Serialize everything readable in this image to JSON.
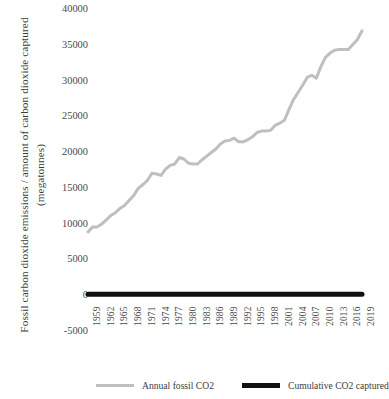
{
  "chart_data": {
    "type": "line",
    "title": "",
    "xlabel": "",
    "ylabel": "Fossil carbon dioxide emissions / amount of carbon dioxide captured",
    "ylabel_line2": "(megatonnes)",
    "ylim": [
      -5000,
      40000
    ],
    "ytick_labels": [
      "40000",
      "35000",
      "30000",
      "25000",
      "20000",
      "15000",
      "10000",
      "5000",
      "0",
      "-5000"
    ],
    "ytick_values": [
      40000,
      35000,
      30000,
      25000,
      20000,
      15000,
      10000,
      5000,
      0,
      -5000
    ],
    "grid": false,
    "legend_position": "bottom",
    "xtick_labels": [
      "1959",
      "1962",
      "1965",
      "1968",
      "1971",
      "1974",
      "1977",
      "1980",
      "1983",
      "1986",
      "1989",
      "1992",
      "1995",
      "1998",
      "2001",
      "2004",
      "2007",
      "2010",
      "2013",
      "2016",
      "2019"
    ],
    "x": [
      1959,
      1960,
      1961,
      1962,
      1963,
      1964,
      1965,
      1966,
      1967,
      1968,
      1969,
      1970,
      1971,
      1972,
      1973,
      1974,
      1975,
      1976,
      1977,
      1978,
      1979,
      1980,
      1981,
      1982,
      1983,
      1984,
      1985,
      1986,
      1987,
      1988,
      1989,
      1990,
      1991,
      1992,
      1993,
      1994,
      1995,
      1996,
      1997,
      1998,
      1999,
      2000,
      2001,
      2002,
      2003,
      2004,
      2005,
      2006,
      2007,
      2008,
      2009,
      2010,
      2011,
      2012,
      2013,
      2014,
      2015,
      2016,
      2017,
      2018,
      2019
    ],
    "series": [
      {
        "name": "Annual fossil CO2",
        "color": "#bfbfbf",
        "width": 3,
        "values": [
          8700,
          9400,
          9400,
          9800,
          10400,
          11000,
          11400,
          12000,
          12400,
          13100,
          13800,
          14800,
          15300,
          15900,
          16900,
          16800,
          16600,
          17500,
          18000,
          18200,
          19100,
          18900,
          18300,
          18200,
          18200,
          18800,
          19300,
          19800,
          20300,
          21000,
          21400,
          21500,
          21800,
          21300,
          21300,
          21600,
          22000,
          22600,
          22800,
          22800,
          22900,
          23600,
          23900,
          24300,
          25800,
          27200,
          28200,
          29200,
          30300,
          30600,
          30200,
          31800,
          33100,
          33700,
          34100,
          34200,
          34200,
          34200,
          34900,
          35600,
          36800
        ]
      },
      {
        "name": "Cumulative CO2 captured",
        "color": "#111111",
        "width": 5,
        "values": [
          0,
          0,
          0,
          0,
          0,
          0,
          0,
          0,
          0,
          0,
          0,
          0,
          0,
          0,
          0,
          0,
          0,
          0,
          0,
          0,
          0,
          0,
          0,
          0,
          0,
          0,
          0,
          0,
          0,
          0,
          0,
          0,
          0,
          0,
          0,
          0,
          0,
          0,
          0,
          0,
          0,
          0,
          0,
          0,
          0,
          0,
          0,
          0,
          0,
          0,
          0,
          0,
          0,
          0,
          0,
          0,
          0,
          0,
          0,
          0,
          0
        ]
      }
    ]
  },
  "legend": {
    "items": [
      {
        "label": "Annual fossil CO2"
      },
      {
        "label": "Cumulative CO2 captured"
      }
    ]
  }
}
